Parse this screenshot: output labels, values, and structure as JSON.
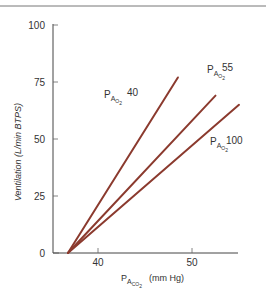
{
  "chart_data": {
    "type": "line",
    "title": "",
    "xlabel": "PACO2 (mm Hg)",
    "xlabel_parts": {
      "main": "P",
      "sub1": "A",
      "sub2": "CO",
      "sub3": "2",
      "unit": "(mm Hg)"
    },
    "ylabel": "Ventilation (L/min BTPS)",
    "xlim": [
      35.2,
      55.5
    ],
    "ylim": [
      0,
      100
    ],
    "x_ticks": [
      40,
      50
    ],
    "y_ticks": [
      0,
      25,
      50,
      75,
      100
    ],
    "grid": false,
    "legend": "inline labels at line ends",
    "line_color": "#8b3a2e",
    "series": [
      {
        "name": "PAO2 40",
        "label_value": "40",
        "x": [
          36.8,
          48.5
        ],
        "y": [
          0,
          77
        ]
      },
      {
        "name": "PAO2 55",
        "label_value": "55",
        "x": [
          36.8,
          52.5
        ],
        "y": [
          0,
          69
        ]
      },
      {
        "name": "PAO2 100",
        "label_value": "100",
        "x": [
          36.8,
          55.0
        ],
        "y": [
          0,
          65
        ]
      }
    ]
  },
  "labels": {
    "p": "P",
    "a": "A",
    "o": "O",
    "two": "2",
    "co": "CO"
  }
}
